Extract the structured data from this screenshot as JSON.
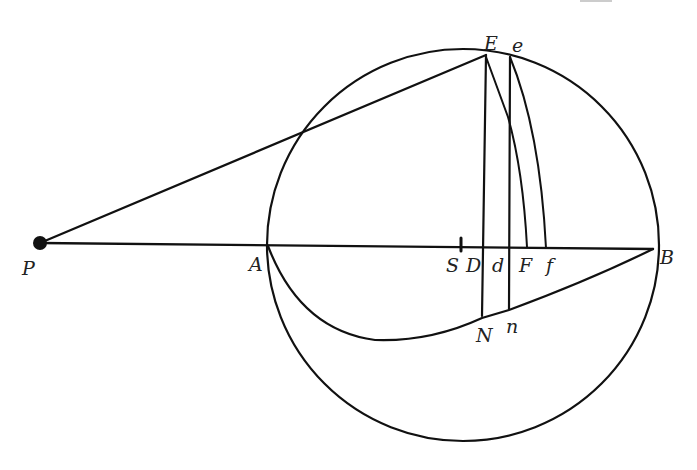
{
  "figure": {
    "stroke_color": "#111111",
    "background": "#ffffff"
  },
  "points": {
    "P": {
      "label": "P",
      "x": 40,
      "y": 243
    },
    "A": {
      "label": "A",
      "x": 268,
      "y": 246
    },
    "S": {
      "label": "S",
      "x": 461,
      "y": 245
    },
    "D": {
      "label": "D",
      "x": 483,
      "y": 247
    },
    "d": {
      "label": "d",
      "x": 509,
      "y": 247
    },
    "F": {
      "label": "F",
      "x": 527,
      "y": 247
    },
    "f": {
      "label": "f",
      "x": 546,
      "y": 248
    },
    "B": {
      "label": "B",
      "x": 653,
      "y": 249
    },
    "E": {
      "label": "E",
      "x": 486,
      "y": 55
    },
    "e": {
      "label": "e",
      "x": 510,
      "y": 57
    },
    "N": {
      "label": "N",
      "x": 482,
      "y": 318
    },
    "n": {
      "label": "n",
      "x": 509,
      "y": 310
    }
  },
  "circle": {
    "cx": 463,
    "cy": 245,
    "r": 196
  },
  "labels": {
    "P": "P",
    "A": "A",
    "S": "S",
    "D": "D",
    "d": "d",
    "F": "F",
    "f": "f",
    "B": "B",
    "E": "E",
    "e": "e",
    "N": "N",
    "n": "n"
  }
}
